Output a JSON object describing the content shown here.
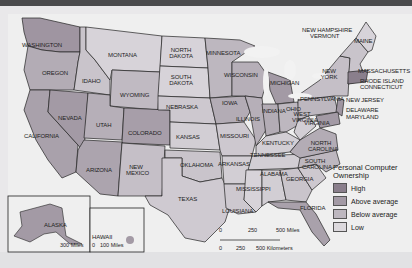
{
  "map": {
    "title": "Personal Computer Ownership",
    "legend": {
      "title": "Personal Computer Ownership",
      "items": [
        {
          "label": "High",
          "color": "#8a7f8c"
        },
        {
          "label": "Above average",
          "color": "#a39aa5"
        },
        {
          "label": "Below average",
          "color": "#bdb7bf"
        },
        {
          "label": "Low",
          "color": "#dcd9dd"
        }
      ]
    },
    "states": [
      "WASHINGTON",
      "OREGON",
      "CALIFORNIA",
      "IDAHO",
      "NEVADA",
      "MONTANA",
      "WYOMING",
      "UTAH",
      "COLORADO",
      "ARIZONA",
      "NEW MEXICO",
      "NORTH DAKOTA",
      "SOUTH DAKOTA",
      "NEBRASKA",
      "KANSAS",
      "OKLAHOMA",
      "TEXAS",
      "MINNESOTA",
      "IOWA",
      "MISSOURI",
      "ARKANSAS",
      "LOUISIANA",
      "WISCONSIN",
      "ILLINOIS",
      "MICHIGAN",
      "INDIANA",
      "OHIO",
      "KENTUCKY",
      "TENNESSEE",
      "MISSISSIPPI",
      "ALABAMA",
      "GEORGIA",
      "FLORIDA",
      "SOUTH CAROLINA",
      "NORTH CAROLINA",
      "VIRGINIA",
      "WEST VIRGINIA",
      "PENNSYLVANIA",
      "NEW YORK",
      "NEW JERSEY",
      "DELAWARE",
      "MARYLAND",
      "NEW HAMPSHIRE",
      "VERMONT",
      "MAINE",
      "MASSACHUSETTS",
      "RHODE ISLAND",
      "CONNECTICUT",
      "ALASKA",
      "HAWAII"
    ],
    "scale_main": {
      "miles": [
        "0",
        "250",
        "500 Miles"
      ],
      "km": [
        "0",
        "250",
        "500 Kilometers"
      ]
    },
    "scale_alaska": "300 Miles",
    "scale_hawaii": {
      "zero": "0",
      "miles": "100 Miles"
    }
  }
}
